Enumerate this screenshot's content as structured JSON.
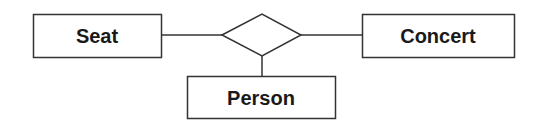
{
  "diagram": {
    "type": "entity-relationship",
    "entities": [
      {
        "id": "seat",
        "label": "Seat"
      },
      {
        "id": "concert",
        "label": "Concert"
      },
      {
        "id": "person",
        "label": "Person"
      }
    ],
    "relationship": {
      "id": "rel",
      "label": "",
      "shape": "diamond"
    },
    "connections": [
      {
        "from": "seat",
        "to": "rel"
      },
      {
        "from": "rel",
        "to": "concert"
      },
      {
        "from": "rel",
        "to": "person"
      }
    ],
    "colors": {
      "stroke": "#333333",
      "text": "#1a1a1a",
      "background": "#ffffff"
    }
  }
}
